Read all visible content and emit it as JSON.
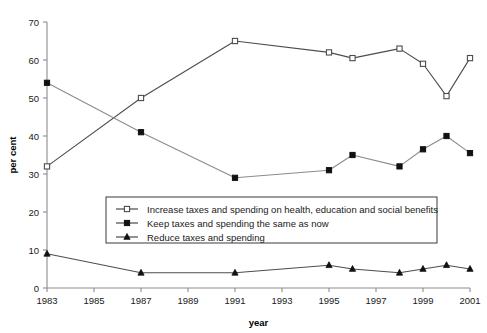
{
  "chart_data": {
    "type": "line",
    "title": "",
    "xlabel": "year",
    "ylabel": "per cent",
    "xlim": [
      1983,
      2001
    ],
    "ylim": [
      0,
      70
    ],
    "grid": false,
    "legend_position": "inside-lower-center",
    "x_tick_labels": [
      "1983",
      "1985",
      "1987",
      "1989",
      "1991",
      "1993",
      "1995",
      "1997",
      "1999",
      "2001"
    ],
    "x_ticks": [
      1983,
      1985,
      1987,
      1989,
      1991,
      1993,
      1995,
      1997,
      1999,
      2001
    ],
    "y_tick_labels": [
      "0",
      "10",
      "20",
      "30",
      "40",
      "50",
      "60",
      "70"
    ],
    "y_ticks": [
      0,
      10,
      20,
      30,
      40,
      50,
      60,
      70
    ],
    "series": [
      {
        "name": "Increase taxes and spending on health, education and social benefits",
        "marker": "open-square",
        "color": "#4d4d4d",
        "x": [
          1983,
          1987,
          1991,
          1995,
          1996,
          1998,
          1999,
          2000,
          2001
        ],
        "values": [
          32,
          50,
          65,
          62,
          60.5,
          63,
          59,
          50.5,
          60.5
        ]
      },
      {
        "name": "Keep taxes and spending the same as now",
        "marker": "filled-square",
        "color": "#8c8c8c",
        "x": [
          1983,
          1987,
          1991,
          1995,
          1996,
          1998,
          1999,
          2000,
          2001
        ],
        "values": [
          54,
          41,
          29,
          31,
          35,
          32,
          36.5,
          40,
          35.5
        ]
      },
      {
        "name": "Reduce taxes and spending",
        "marker": "filled-triangle",
        "color": "#4d4d4d",
        "x": [
          1983,
          1987,
          1991,
          1995,
          1996,
          1998,
          1999,
          2000,
          2001
        ],
        "values": [
          9,
          4,
          4,
          6,
          5,
          4,
          5,
          6,
          5
        ]
      }
    ]
  },
  "legend": {
    "items": [
      {
        "label": "Increase taxes and spending on health, education and social benefits",
        "marker": "open-square"
      },
      {
        "label": "Keep taxes and spending the same as now",
        "marker": "filled-square"
      },
      {
        "label": "Reduce taxes and spending",
        "marker": "filled-triangle"
      }
    ]
  }
}
